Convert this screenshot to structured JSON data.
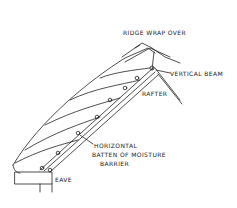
{
  "diagram": {
    "type": "hand-drawn roof cross-section sketch",
    "labels": {
      "ridge": "RIDGE WRAP OVER",
      "vertical_beam": "VERTICAL BEAM",
      "rafter": "RAFTER",
      "batten_line1": "HORIZONTAL",
      "batten_line2": "BATTEN OF MOISTURE",
      "batten_line3": "BARRIER",
      "eave": "EAVE"
    },
    "stroke_color": "#222222",
    "background": "#ffffff"
  }
}
